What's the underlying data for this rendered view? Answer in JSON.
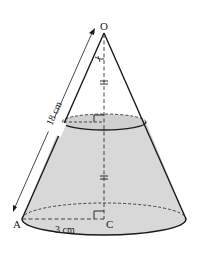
{
  "diagram": {
    "type": "frustum-of-cone",
    "apex_label": "O",
    "base_point_label": "A",
    "base_center_label": "C",
    "slant_length_label": "18 cm",
    "radius_label": "3 cm",
    "colors": {
      "stroke": "#1a1a1a",
      "fill": "#d6d6d6",
      "top_fill": "#d0d0d0",
      "dash": "#333333"
    }
  }
}
